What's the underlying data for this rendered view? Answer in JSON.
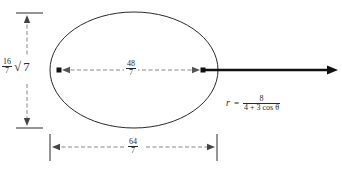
{
  "figure": {
    "type": "conic-section-diagram",
    "shape": "ellipse"
  },
  "labels": {
    "minor_axis": {
      "coefficient_num": "16",
      "coefficient_den": "7",
      "radical": "7",
      "radical_symbol": "√"
    },
    "focal_distance": {
      "num": "48",
      "den": "7"
    },
    "major_axis": {
      "num": "64",
      "den": "7"
    }
  },
  "equation": {
    "lhs": "r",
    "relation": "=",
    "numerator": "8",
    "denominator_a": "4",
    "denominator_plus": "+",
    "denominator_b": "3",
    "denominator_fn": "cos",
    "denominator_var": "θ"
  },
  "colors": {
    "stroke": "#2a2a2a",
    "dashed": "#777777",
    "background": "#ffffff"
  },
  "geometry": {
    "ellipse": {
      "cx": 134,
      "cy": 70,
      "rx": 84,
      "ry": 58
    },
    "left_focus": {
      "x": 59,
      "y": 70
    },
    "right_focus": {
      "x": 203,
      "y": 70
    },
    "ray_tip": {
      "x": 338,
      "y": 70
    },
    "vertical_dim_x": 27,
    "vertical_dim_top": 13,
    "vertical_dim_bottom": 128,
    "horizontal_dim_y": 147,
    "horizontal_dim_left": 50,
    "horizontal_dim_right": 217
  }
}
